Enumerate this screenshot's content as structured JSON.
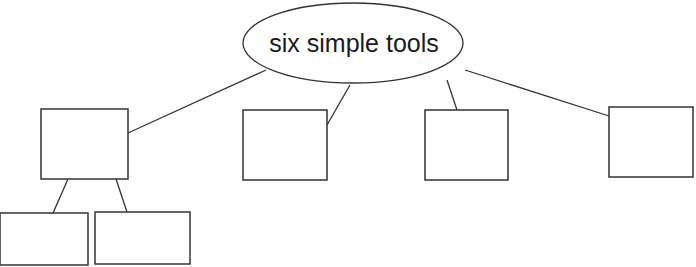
{
  "diagram": {
    "type": "tree",
    "root": {
      "label": "six simple tools"
    },
    "colors": {
      "stroke": "#333333",
      "fill": "#ffffff",
      "text": "#1a1a1a"
    },
    "nodes": [
      {
        "id": "box-1",
        "label": "",
        "children": [
          "box-1a",
          "box-1b"
        ]
      },
      {
        "id": "box-2",
        "label": ""
      },
      {
        "id": "box-3",
        "label": ""
      },
      {
        "id": "box-4",
        "label": ""
      },
      {
        "id": "box-1a",
        "label": ""
      },
      {
        "id": "box-1b",
        "label": ""
      }
    ]
  }
}
